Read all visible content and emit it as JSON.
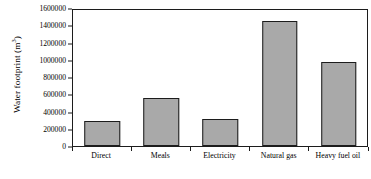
{
  "chart_data": {
    "type": "bar",
    "title": "",
    "xlabel": "",
    "ylabel": "Water footprint (m3)",
    "ylabel_text": "Water footprint (m",
    "ylabel_sup": "3",
    "ylabel_suffix": ")",
    "categories": [
      "Direct",
      "Meals",
      "Electricity",
      "Natural gas",
      "Heavy fuel oil"
    ],
    "values": [
      295000,
      560000,
      315000,
      1450000,
      975000
    ],
    "ylim": [
      0,
      1600000
    ],
    "ytick_labels": [
      "0",
      "200000",
      "400000",
      "600000",
      "800000",
      "1000000",
      "1200000",
      "1400000",
      "1600000"
    ],
    "ytick_values": [
      0,
      200000,
      400000,
      600000,
      800000,
      1000000,
      1200000,
      1400000,
      1600000
    ],
    "grid": false,
    "legend": "none",
    "bar_fill_color": "#a9a9a9",
    "bar_edge_color": "#1c1c1c",
    "axis_color": "#1c1c1c",
    "background_color": "#ffffff"
  }
}
